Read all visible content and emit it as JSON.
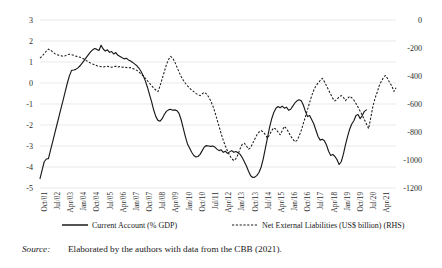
{
  "figure": {
    "source_label": "Source:",
    "source_text": "Elaborated by the authors with data from the CBB (2021)."
  },
  "chart_data": {
    "type": "line",
    "title": "",
    "xlabel": "",
    "ylabel": "",
    "grid": true,
    "legend_position": "bottom",
    "ylim": [
      -5,
      3
    ],
    "yticks": [
      "3",
      "2",
      "1",
      "0",
      "-1",
      "-2",
      "-3",
      "-4",
      "-5"
    ],
    "y2lim": [
      -1200,
      0
    ],
    "y2ticks": [
      "0",
      "-200",
      "-400",
      "-600",
      "-800",
      "-1000",
      "-1200"
    ],
    "xticks": [
      "Oct/01",
      "Jul/02",
      "Apr/03",
      "Jan/04",
      "Oct/04",
      "Jul/05",
      "Apr/06",
      "Jan/07",
      "Oct/07",
      "Jul/08",
      "Apr/09",
      "Jan/10",
      "Oct/10",
      "Jul/11",
      "Apr/12",
      "Jan/13",
      "Oct/13",
      "Jul/14",
      "Apr/15",
      "Jan/16",
      "Oct/16",
      "Jul/17",
      "Apr/18",
      "Jan/19",
      "Oct/19",
      "Jul/20",
      "Apr/21"
    ],
    "series": [
      {
        "name": "Current Account (% GDP)",
        "axis": "left",
        "style": "solid",
        "values": [
          -4.55,
          -4.15,
          -3.75,
          -3.62,
          -3.6,
          -3.2,
          -2.8,
          -2.4,
          -2.0,
          -1.6,
          -1.2,
          -0.8,
          -0.4,
          0.0,
          0.35,
          0.6,
          0.62,
          0.65,
          0.72,
          0.82,
          0.95,
          1.08,
          1.22,
          1.35,
          1.48,
          1.58,
          1.64,
          1.6,
          1.55,
          1.8,
          1.62,
          1.52,
          1.58,
          1.46,
          1.5,
          1.38,
          1.45,
          1.32,
          1.26,
          1.2,
          1.15,
          1.18,
          1.1,
          1.05,
          0.98,
          0.9,
          0.82,
          0.7,
          0.55,
          0.35,
          0.1,
          -0.2,
          -0.55,
          -0.9,
          -1.3,
          -1.6,
          -1.78,
          -1.82,
          -1.7,
          -1.5,
          -1.35,
          -1.28,
          -1.25,
          -1.3,
          -1.28,
          -1.32,
          -1.45,
          -1.75,
          -2.15,
          -2.55,
          -2.9,
          -3.1,
          -3.3,
          -3.45,
          -3.52,
          -3.5,
          -3.4,
          -3.22,
          -3.05,
          -2.98,
          -3.0,
          -3.02,
          -3.0,
          -3.05,
          -3.15,
          -3.22,
          -3.18,
          -3.3,
          -3.25,
          -3.35,
          -3.28,
          -3.22,
          -3.3,
          -3.26,
          -3.32,
          -3.4,
          -3.55,
          -3.75,
          -3.95,
          -4.2,
          -4.42,
          -4.5,
          -4.48,
          -4.4,
          -4.25,
          -4.0,
          -3.6,
          -3.1,
          -2.6,
          -2.1,
          -1.7,
          -1.4,
          -1.2,
          -1.12,
          -1.18,
          -1.1,
          -1.2,
          -1.15,
          -1.3,
          -1.25,
          -1.1,
          -0.95,
          -0.85,
          -0.8,
          -0.85,
          -1.05,
          -1.35,
          -1.6,
          -1.55,
          -1.75,
          -1.95,
          -2.25,
          -2.55,
          -2.72,
          -2.68,
          -2.75,
          -2.95,
          -3.25,
          -3.45,
          -3.4,
          -3.5,
          -3.65,
          -3.88,
          -3.75,
          -3.4,
          -2.95,
          -2.55,
          -2.2,
          -1.95,
          -1.8,
          -1.55,
          -1.5,
          -1.7,
          -1.55,
          -1.35,
          -1.28
        ]
      },
      {
        "name": "Net External Liabilities (US$ billion) (RHS)",
        "axis": "right",
        "style": "dashed",
        "values": [
          -272,
          -258,
          -240,
          -222,
          -208,
          -215,
          -228,
          -240,
          -248,
          -252,
          -256,
          -260,
          -255,
          -248,
          -244,
          -248,
          -252,
          -258,
          -262,
          -266,
          -272,
          -280,
          -290,
          -300,
          -308,
          -315,
          -320,
          -326,
          -330,
          -334,
          -336,
          -332,
          -330,
          -334,
          -338,
          -334,
          -330,
          -336,
          -332,
          -338,
          -336,
          -340,
          -344,
          -340,
          -346,
          -352,
          -360,
          -372,
          -386,
          -400,
          -416,
          -434,
          -452,
          -470,
          -486,
          -500,
          -512,
          -470,
          -420,
          -370,
          -320,
          -282,
          -260,
          -272,
          -300,
          -336,
          -372,
          -404,
          -430,
          -452,
          -470,
          -486,
          -500,
          -512,
          -524,
          -534,
          -540,
          -528,
          -516,
          -528,
          -548,
          -576,
          -612,
          -656,
          -708,
          -760,
          -812,
          -860,
          -900,
          -936,
          -966,
          -990,
          -1004,
          -990,
          -960,
          -920,
          -888,
          -880,
          -900,
          -922,
          -912,
          -880,
          -850,
          -820,
          -800,
          -790,
          -800,
          -820,
          -844,
          -820,
          -790,
          -770,
          -780,
          -800,
          -820,
          -790,
          -760,
          -776,
          -800,
          -830,
          -850,
          -870,
          -860,
          -830,
          -790,
          -740,
          -690,
          -640,
          -590,
          -540,
          -500,
          -470,
          -450,
          -432,
          -416,
          -440,
          -470,
          -500,
          -530,
          -560,
          -578,
          -566,
          -550,
          -540,
          -552,
          -576,
          -560,
          -545,
          -556,
          -572,
          -596,
          -624,
          -652,
          -680,
          -712,
          -744,
          -776,
          -700,
          -620,
          -560,
          -520,
          -470,
          -440,
          -412,
          -396,
          -418,
          -448,
          -470,
          -510,
          -484
        ]
      }
    ],
    "legend": [
      {
        "label": "Current Account (% GDP)",
        "style": "solid"
      },
      {
        "label": "Net External Liabilities (US$ billion) (RHS)",
        "style": "dashed"
      }
    ]
  }
}
